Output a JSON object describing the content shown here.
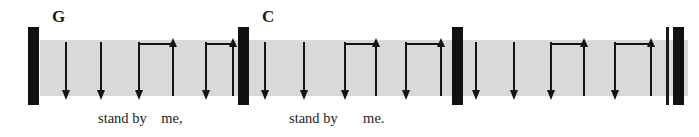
{
  "figure": {
    "kind": "guitar-strumming-pattern",
    "background_color": "#ffffff",
    "band_color": "#d9d9d9",
    "ink_color": "#141414",
    "band": {
      "x": 40,
      "y": 40,
      "width": 648,
      "height": 56
    }
  },
  "barlines": [
    {
      "name": "barline-start",
      "x": 28,
      "y": 27,
      "width": 11,
      "height": 78,
      "style": "thick"
    },
    {
      "name": "barline-measure-1-end",
      "x": 238,
      "y": 27,
      "width": 11,
      "height": 78,
      "style": "thick"
    },
    {
      "name": "barline-measure-2-end",
      "x": 452,
      "y": 27,
      "width": 11,
      "height": 78,
      "style": "thick"
    },
    {
      "name": "final-barline-thin",
      "x": 666,
      "y": 27,
      "width": 3,
      "height": 78,
      "style": "thin"
    },
    {
      "name": "final-barline-thick",
      "x": 673,
      "y": 27,
      "width": 11,
      "height": 78,
      "style": "thick"
    }
  ],
  "measures": [
    {
      "index": 1,
      "chord": "G",
      "chord_x": 52,
      "chord_y": 8,
      "lyric": "stand by    me,",
      "lyric_x": 98,
      "lyric_y": 111,
      "strokes": [
        {
          "beat": "1",
          "direction": "down",
          "x": 65,
          "symbol": "↓"
        },
        {
          "beat": "2",
          "direction": "down",
          "x": 100,
          "symbol": "↓"
        },
        {
          "beat": "3",
          "direction": "down",
          "x": 138,
          "symbol": "↓"
        },
        {
          "beat": "3-&",
          "direction": "up",
          "x": 172,
          "symbol": "↑"
        },
        {
          "beat": "4",
          "direction": "down",
          "x": 205,
          "symbol": "↓"
        },
        {
          "beat": "4-&",
          "direction": "up",
          "x": 232,
          "symbol": "↑"
        }
      ],
      "brackets": [
        {
          "from_x": 138,
          "to_x": 172
        },
        {
          "from_x": 205,
          "to_x": 232
        }
      ]
    },
    {
      "index": 2,
      "chord": "C",
      "chord_x": 262,
      "chord_y": 8,
      "lyric": "stand by       me.",
      "lyric_x": 289,
      "lyric_y": 111,
      "strokes": [
        {
          "beat": "1",
          "direction": "down",
          "x": 264,
          "symbol": "↓"
        },
        {
          "beat": "2",
          "direction": "down",
          "x": 303,
          "symbol": "↓"
        },
        {
          "beat": "3",
          "direction": "down",
          "x": 344,
          "symbol": "↓"
        },
        {
          "beat": "3-&",
          "direction": "up",
          "x": 375,
          "symbol": "↑"
        },
        {
          "beat": "4",
          "direction": "down",
          "x": 405,
          "symbol": "↓"
        },
        {
          "beat": "4-&",
          "direction": "up",
          "x": 440,
          "symbol": "↑"
        }
      ],
      "brackets": [
        {
          "from_x": 344,
          "to_x": 375
        },
        {
          "from_x": 405,
          "to_x": 440
        }
      ]
    },
    {
      "index": 3,
      "chord": "",
      "chord_x": 0,
      "chord_y": 0,
      "lyric": "",
      "lyric_x": 0,
      "lyric_y": 0,
      "strokes": [
        {
          "beat": "1",
          "direction": "down",
          "x": 475,
          "symbol": "↓"
        },
        {
          "beat": "2",
          "direction": "down",
          "x": 513,
          "symbol": "↓"
        },
        {
          "beat": "3",
          "direction": "down",
          "x": 550,
          "symbol": "↓"
        },
        {
          "beat": "3-&",
          "direction": "up",
          "x": 583,
          "symbol": "↑"
        },
        {
          "beat": "4",
          "direction": "down",
          "x": 614,
          "symbol": "↓"
        },
        {
          "beat": "4-&",
          "direction": "up",
          "x": 650,
          "symbol": "↑"
        }
      ],
      "brackets": [
        {
          "from_x": 550,
          "to_x": 583
        },
        {
          "from_x": 614,
          "to_x": 650
        }
      ]
    }
  ],
  "geometry": {
    "down_stroke_top": 42,
    "down_stroke_bottom": 92,
    "up_stroke_top": 45,
    "up_stroke_bottom": 96,
    "bracket_y": 43
  }
}
